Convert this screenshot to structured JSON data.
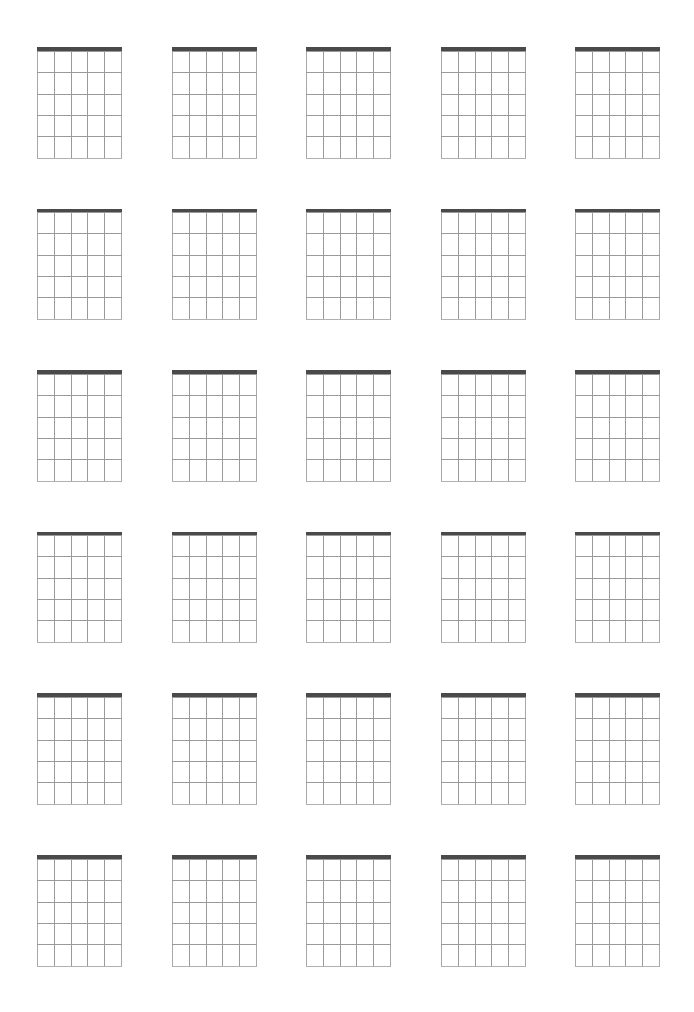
{
  "page": {
    "background_color": "#ffffff",
    "width": 694,
    "height": 1012
  },
  "sheet": {
    "name": "blank-chord-diagram-sheet",
    "diagram_count": 30,
    "columns": 5,
    "rows": 6
  },
  "diagram_template": {
    "type": "guitar-chord-diagram",
    "state": "blank",
    "strings": 6,
    "frets": 5,
    "fret_lines": 6,
    "has_nut": true,
    "label": "",
    "fret_position_label": "",
    "width_px": 85,
    "height_px": 111,
    "colors": {
      "nut": "#4a4a4a",
      "string": "#9a9a9a",
      "fret": "#9a9a9a",
      "fret_last": "#b0b0b0",
      "background": "#ffffff"
    },
    "nut_thickness_px": 3.5,
    "line_thickness_px": 1
  },
  "layout": {
    "origin_x": 37,
    "origin_y": 47,
    "column_pitch_px": 134.5,
    "row_pitch_px": 161.6,
    "string_spacing_px": 17,
    "fret_spacing_px": 21.5
  },
  "diagrams": [
    {
      "id": 1,
      "row": 1,
      "col": 1,
      "label": ""
    },
    {
      "id": 2,
      "row": 1,
      "col": 2,
      "label": ""
    },
    {
      "id": 3,
      "row": 1,
      "col": 3,
      "label": ""
    },
    {
      "id": 4,
      "row": 1,
      "col": 4,
      "label": ""
    },
    {
      "id": 5,
      "row": 1,
      "col": 5,
      "label": ""
    },
    {
      "id": 6,
      "row": 2,
      "col": 1,
      "label": ""
    },
    {
      "id": 7,
      "row": 2,
      "col": 2,
      "label": ""
    },
    {
      "id": 8,
      "row": 2,
      "col": 3,
      "label": ""
    },
    {
      "id": 9,
      "row": 2,
      "col": 4,
      "label": ""
    },
    {
      "id": 10,
      "row": 2,
      "col": 5,
      "label": ""
    },
    {
      "id": 11,
      "row": 3,
      "col": 1,
      "label": ""
    },
    {
      "id": 12,
      "row": 3,
      "col": 2,
      "label": ""
    },
    {
      "id": 13,
      "row": 3,
      "col": 3,
      "label": ""
    },
    {
      "id": 14,
      "row": 3,
      "col": 4,
      "label": ""
    },
    {
      "id": 15,
      "row": 3,
      "col": 5,
      "label": ""
    },
    {
      "id": 16,
      "row": 4,
      "col": 1,
      "label": ""
    },
    {
      "id": 17,
      "row": 4,
      "col": 2,
      "label": ""
    },
    {
      "id": 18,
      "row": 4,
      "col": 3,
      "label": ""
    },
    {
      "id": 19,
      "row": 4,
      "col": 4,
      "label": ""
    },
    {
      "id": 20,
      "row": 4,
      "col": 5,
      "label": ""
    },
    {
      "id": 21,
      "row": 5,
      "col": 1,
      "label": ""
    },
    {
      "id": 22,
      "row": 5,
      "col": 2,
      "label": ""
    },
    {
      "id": 23,
      "row": 5,
      "col": 3,
      "label": ""
    },
    {
      "id": 24,
      "row": 5,
      "col": 4,
      "label": ""
    },
    {
      "id": 25,
      "row": 5,
      "col": 5,
      "label": ""
    },
    {
      "id": 26,
      "row": 6,
      "col": 1,
      "label": ""
    },
    {
      "id": 27,
      "row": 6,
      "col": 2,
      "label": ""
    },
    {
      "id": 28,
      "row": 6,
      "col": 3,
      "label": ""
    },
    {
      "id": 29,
      "row": 6,
      "col": 4,
      "label": ""
    },
    {
      "id": 30,
      "row": 6,
      "col": 5,
      "label": ""
    }
  ]
}
